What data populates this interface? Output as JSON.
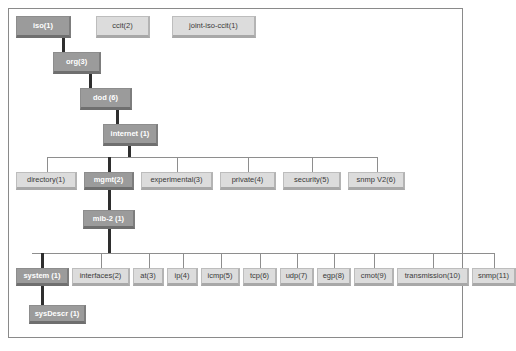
{
  "diagram": {
    "colors": {
      "node_fill": "#dcdcdc",
      "node_text": "#3a3a3a",
      "highlight_fill": "#9b9b9b",
      "highlight_text": "#ffffff",
      "edge": "#8e8e8e",
      "edge_highlight": "#2e2e2e",
      "frame_border": "#8a8a8a",
      "background": "#ffffff"
    },
    "levels": [
      {
        "name": "root-level",
        "nodes": [
          {
            "id": "iso",
            "label": "iso(1)",
            "highlighted": true
          },
          {
            "id": "ccit",
            "label": "ccit(2)",
            "highlighted": false
          },
          {
            "id": "joint-iso-ccit",
            "label": "joint-iso-ccit(1)",
            "highlighted": false
          }
        ]
      },
      {
        "name": "org-level",
        "nodes": [
          {
            "id": "org",
            "label": "org(3)",
            "highlighted": true
          }
        ]
      },
      {
        "name": "dod-level",
        "nodes": [
          {
            "id": "dod",
            "label": "dod (6)",
            "highlighted": true
          }
        ]
      },
      {
        "name": "internet-level",
        "nodes": [
          {
            "id": "internet",
            "label": "internet  (1)",
            "highlighted": true
          }
        ]
      },
      {
        "name": "internet-children",
        "nodes": [
          {
            "id": "directory",
            "label": "directory(1)",
            "highlighted": false
          },
          {
            "id": "mgmt",
            "label": "mgmt(2)",
            "highlighted": true
          },
          {
            "id": "experimental",
            "label": "experimental(3)",
            "highlighted": false
          },
          {
            "id": "private",
            "label": "private(4)",
            "highlighted": false
          },
          {
            "id": "security",
            "label": "security(5)",
            "highlighted": false
          },
          {
            "id": "snmpv2",
            "label": "snmp V2(6)",
            "highlighted": false
          }
        ]
      },
      {
        "name": "mib2-level",
        "nodes": [
          {
            "id": "mib-2",
            "label": "mib-2  (1)",
            "highlighted": true
          }
        ]
      },
      {
        "name": "mib2-children",
        "nodes": [
          {
            "id": "system",
            "label": "system  (1)",
            "highlighted": true
          },
          {
            "id": "interfaces",
            "label": "interfaces(2)",
            "highlighted": false
          },
          {
            "id": "at",
            "label": "at(3)",
            "highlighted": false
          },
          {
            "id": "ip",
            "label": "ip(4)",
            "highlighted": false
          },
          {
            "id": "icmp",
            "label": "icmp(5)",
            "highlighted": false
          },
          {
            "id": "tcp",
            "label": "tcp(6)",
            "highlighted": false
          },
          {
            "id": "udp",
            "label": "udp(7)",
            "highlighted": false
          },
          {
            "id": "egp",
            "label": "egp(8)",
            "highlighted": false
          },
          {
            "id": "cmot",
            "label": "cmot(9)",
            "highlighted": false
          },
          {
            "id": "transmission",
            "label": "transmission(10)",
            "highlighted": false
          },
          {
            "id": "snmp",
            "label": "snmp(11)",
            "highlighted": false
          }
        ]
      },
      {
        "name": "sysdescr-level",
        "nodes": [
          {
            "id": "sysDescr",
            "label": "sysDescr  (1)",
            "highlighted": true
          }
        ]
      }
    ]
  }
}
